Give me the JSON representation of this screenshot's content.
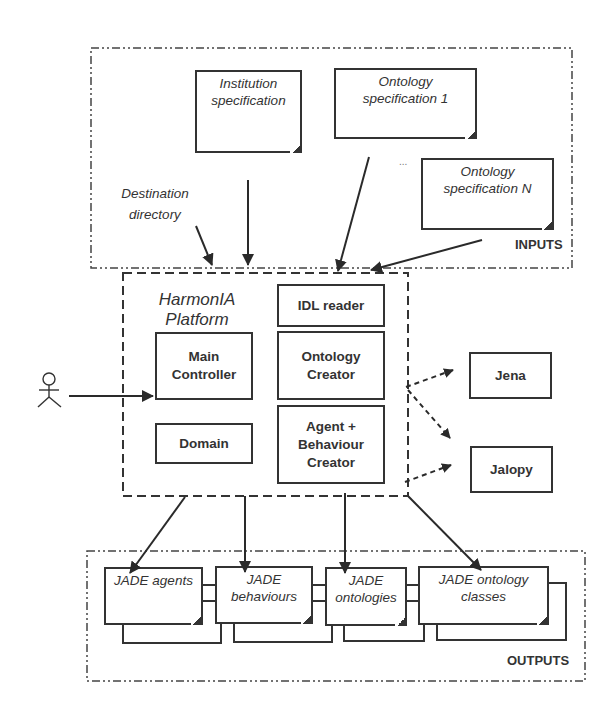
{
  "inputs": {
    "label": "INPUTS",
    "documents": [
      {
        "line1": "Institution",
        "line2": "specification"
      },
      {
        "line1": "Ontology",
        "line2": "specification 1"
      },
      {
        "line1": "Ontology",
        "line2": "specification N"
      }
    ],
    "ellipsis": "...",
    "destination": {
      "line1": "Destination",
      "line2": "directory"
    }
  },
  "platform": {
    "title_line1": "HarmonIA",
    "title_line2": "Platform",
    "components": {
      "idl_reader": "IDL reader",
      "main_controller": {
        "line1": "Main",
        "line2": "Controller"
      },
      "ontology_creator": {
        "line1": "Ontology",
        "line2": "Creator"
      },
      "domain": "Domain",
      "agent_creator": {
        "line1": "Agent +",
        "line2": "Behaviour",
        "line3": "Creator"
      }
    }
  },
  "external": {
    "jena": "Jena",
    "jalopy": "Jalopy"
  },
  "actor": {
    "name": "user-actor"
  },
  "outputs": {
    "label": "OUTPUTS",
    "documents": [
      {
        "line1": "JADE agents",
        "line2": ""
      },
      {
        "line1": "JADE",
        "line2": "behaviours"
      },
      {
        "line1": "JADE",
        "line2": "ontologies"
      },
      {
        "line1": "JADE ontology",
        "line2": "classes"
      }
    ]
  },
  "colors": {
    "line": "#333333",
    "background": "#ffffff"
  }
}
